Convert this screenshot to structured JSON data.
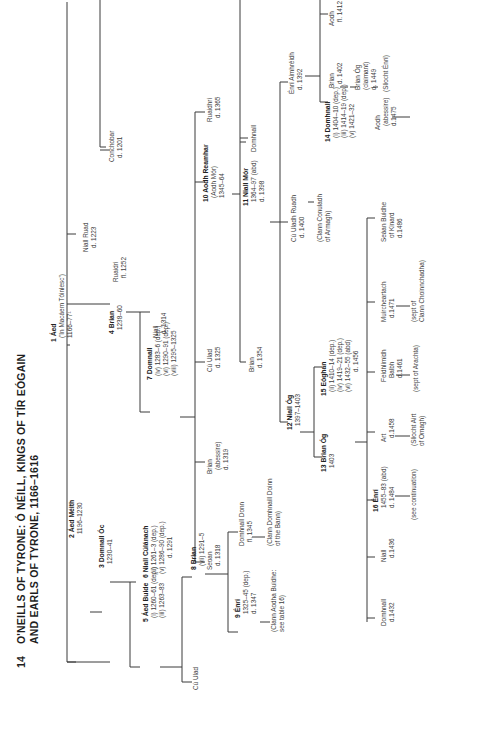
{
  "title": {
    "number": "14",
    "line1": "O'NEILLS OF TYRONE: Ó NÉILL, KINGS OF TÍR EÓGAIN",
    "line2": "AND EARLS OF TYRONE, 1166–1616"
  },
  "people": {
    "aed1": {
      "name": "1 Áed",
      "lines": [
        "('In Macáem Tóinlesc')",
        "1166–77¹"
      ]
    },
    "aed_meith": {
      "name": "2 Áed Méith",
      "lines": [
        "1196–1230"
      ]
    },
    "domnall_oc": {
      "name": "3 Domnall Óc",
      "lines": [
        "1230–41"
      ]
    },
    "brian4": {
      "name": "4 Brian",
      "lines": [
        "1238–60"
      ]
    },
    "aed_buide": {
      "name": "5 Áed Buide",
      "lines": [
        "(i) 1260–61 (dep.)",
        "(iii) 1263–83"
      ]
    },
    "niall_culanach": {
      "name": "6 Niall Cúlánach",
      "lines": [
        "(ii) 1261–3 (dep.)",
        "(v) 1286–90 (dep.)",
        "d. 1291"
      ]
    },
    "domnall7": {
      "name": "7 Domnall",
      "lines": [
        "(iv) 1283–6 (dep.)",
        "(vi) 1290–91 (dep.)",
        "(viii) 1295–1325"
      ]
    },
    "brian8": {
      "name": "8 Brian",
      "lines": [
        "(vii) 1291–5"
      ]
    },
    "enri9": {
      "name": "9 Énrí",
      "lines": [
        "1325–45 (dep.)",
        "d. 1347"
      ]
    },
    "aodh10": {
      "name": "10 Aodh Reamhar",
      "lines": [
        "(Aodh Mór)",
        "1345–64"
      ]
    },
    "niall11": {
      "name": "11 Niall Mór",
      "lines": [
        "1364–97 (abd)",
        "d. 1398"
      ]
    },
    "niall12": {
      "name": "12 Niall Óg",
      "lines": [
        "1397–1403"
      ]
    },
    "brian13": {
      "name": "13 Brian Óg",
      "lines": [
        "1403"
      ]
    },
    "domhnall14": {
      "name": "14 Domhnall",
      "lines": [
        "(i) 1404–10 (dep.)",
        "(iii) 1414–19 (dep.)",
        "(v) 1421–32"
      ]
    },
    "eoghan15": {
      "name": "15 Eóghan",
      "lines": [
        "(ii) 1410–14 (dep.)",
        "(iv) 1419–21 (dep.)",
        "(vi) 1432–55 (abd)",
        "d. 1456"
      ]
    },
    "enri16": {
      "name": "16 Énrí",
      "lines": [
        "1455–83 (abd)",
        "d. 1484"
      ]
    },
    "niall_ruad": {
      "name": "Niall Ruad",
      "lines": [
        "d. 1223"
      ]
    },
    "conchobar": {
      "name": "Conchobar",
      "lines": [
        "d. 1201"
      ]
    },
    "ruaidri1252": {
      "name": "Ruaidri",
      "lines": [
        "fl. 1252"
      ]
    },
    "niall1314": {
      "name": "Niall",
      "lines": [
        "d. 1314"
      ]
    },
    "cu_ulad1": {
      "name": "Cú Ulad",
      "lines": []
    },
    "domhnall_donn": {
      "name": "Domhnall Donn",
      "lines": [
        "fl. 1345"
      ]
    },
    "clann_domhnaill_duinn": {
      "name": "(Clann Domhnaill Doinn",
      "lines": [
        "of the Bann)"
      ]
    },
    "clann_aodha_buidhe": {
      "name": "(Clann Aodha Buidhe:",
      "lines": [
        "see table 16)"
      ]
    },
    "seoan": {
      "name": "Seoan",
      "lines": [
        "d. 1318"
      ]
    },
    "brian_abessire": {
      "name": "Brian",
      "lines": [
        "(abessire)",
        "d. 1319"
      ]
    },
    "cu_ulad1325": {
      "name": "Cú Ulad",
      "lines": [
        "d. 1325"
      ]
    },
    "ruaidhri1365": {
      "name": "Ruaidhri",
      "lines": [
        "d. 1365"
      ]
    },
    "brian1354": {
      "name": "Brian",
      "lines": [
        "d. 1354"
      ]
    },
    "domhnall_x": {
      "name": "Domhnall",
      "lines": []
    },
    "cu_uladh_ruadh": {
      "name": "Cú Uladh Ruadh",
      "lines": [
        "d. 1400"
      ]
    },
    "clann_conuladh": {
      "name": "(Clann Conuladh",
      "lines": [
        "of Armagh)"
      ]
    },
    "enri_aimhreidh": {
      "name": "Énrí Aimhréidh",
      "lines": [
        "d. 1392"
      ]
    },
    "brian1402": {
      "name": "Brian",
      "lines": [
        "d. 1402"
      ]
    },
    "aodh1412": {
      "name": "Aodh",
      "lines": [
        "fl. 1412"
      ]
    },
    "brian_og_claimant": {
      "name": "Brian Óg",
      "lines": [
        "(claimant)",
        "d. 1449"
      ]
    },
    "sliocht_enri": {
      "name": "(Sliocht Énrí)",
      "lines": []
    },
    "domhnall1432": {
      "name": "Domhnall",
      "lines": [
        "d.1432"
      ]
    },
    "niall1436": {
      "name": "Niall",
      "lines": [
        "d.1436"
      ]
    },
    "see_continuation": {
      "name": "(see continuation)",
      "lines": []
    },
    "art1458": {
      "name": "Art",
      "lines": [
        "d.1458"
      ]
    },
    "sliocht_airt": {
      "name": "(Sliocht Airt",
      "lines": [
        "of Omagh)"
      ]
    },
    "feidhlimidh": {
      "name": "Feidhlimidh",
      "lines": [
        "Balbh",
        "d.1461"
      ]
    },
    "sept_aracht": {
      "name": "(sept of Arachta)",
      "lines": []
    },
    "muircheartach": {
      "name": "Muircheartach",
      "lines": [
        "d.1471"
      ]
    },
    "sept_clann_choinn": {
      "name": "(sept of",
      "lines": [
        "Clann Choinnchadha)"
      ]
    },
    "seaan_buidhe": {
      "name": "Seáan Buidhe",
      "lines": [
        "of Kinard",
        "d.1486"
      ]
    },
    "aodh1475": {
      "name": "Aodh",
      "lines": [
        "(abessire)",
        "d.1475"
      ]
    }
  }
}
